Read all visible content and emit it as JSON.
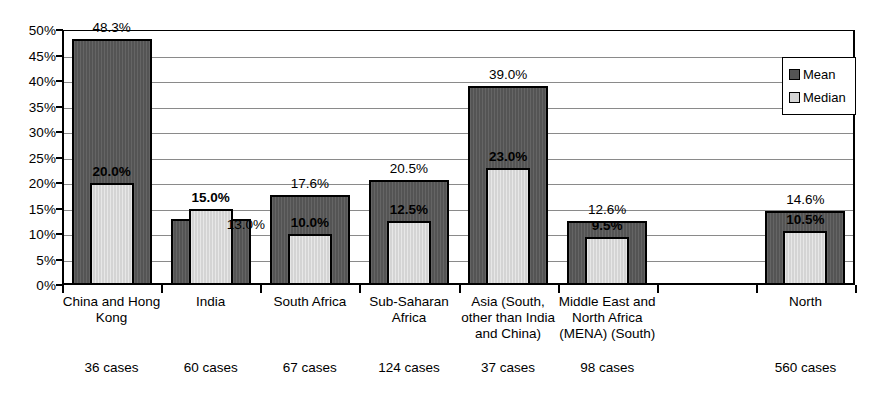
{
  "chart_data": {
    "type": "bar",
    "title": "",
    "xlabel": "",
    "ylabel": "",
    "ylim": [
      0,
      50
    ],
    "ytick_labels": [
      "0%",
      "5%",
      "10%",
      "15%",
      "20%",
      "25%",
      "30%",
      "35%",
      "40%",
      "45%",
      "50%"
    ],
    "ytick_values": [
      0,
      5,
      10,
      15,
      20,
      25,
      30,
      35,
      40,
      45,
      50
    ],
    "grid": "horizontal",
    "legend_position": "top-right",
    "categories": [
      "China and Hong\nKong",
      "India",
      "South Africa",
      "Sub-Saharan\nAfrica",
      "Asia (South,\nother than India\nand China)",
      "Middle East and\nNorth Africa\n(MENA) (South)",
      "",
      "North"
    ],
    "secondary_labels": [
      "36 cases",
      "60 cases",
      "67 cases",
      "124 cases",
      "37 cases",
      "98 cases",
      "",
      "560 cases"
    ],
    "series": [
      {
        "name": "Mean",
        "color": "#545454",
        "values": [
          48.3,
          13.0,
          17.6,
          20.5,
          39.0,
          12.6,
          null,
          14.6
        ],
        "labels": [
          "48.3%",
          "13.0%",
          "17.6%",
          "20.5%",
          "39.0%",
          "12.6%",
          "",
          "14.6%"
        ]
      },
      {
        "name": "Median",
        "color": "#d4d4d4",
        "values": [
          20.0,
          15.0,
          10.0,
          12.5,
          23.0,
          9.5,
          null,
          10.5
        ],
        "labels": [
          "20.0%",
          "15.0%",
          "10.0%",
          "12.5%",
          "23.0%",
          "9.5%",
          "",
          "10.5%"
        ]
      }
    ]
  },
  "legend": {
    "items": [
      {
        "label": "Mean",
        "swatch": "mean"
      },
      {
        "label": "Median",
        "swatch": "median"
      }
    ]
  },
  "colors": {
    "mean": "#545454",
    "median": "#d4d4d4",
    "axis": "#000000",
    "gridline": "#8a8a8a",
    "background": "#ffffff"
  }
}
